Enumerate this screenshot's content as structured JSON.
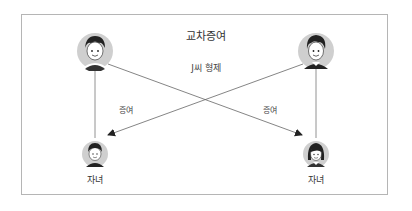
{
  "title": "교차증여",
  "subtitle": "J씨 형제",
  "edges": [
    {
      "label": "증여",
      "from": "parent-left",
      "to": "child-right"
    },
    {
      "label": "증여",
      "from": "parent-right",
      "to": "child-left"
    }
  ],
  "nodes": {
    "parent_left": {
      "role": "parent"
    },
    "parent_right": {
      "role": "parent"
    },
    "child_left": {
      "label": "자녀"
    },
    "child_right": {
      "label": "자녀"
    }
  },
  "colors": {
    "frame": "#b5b5b5",
    "line": "#555555",
    "avatar_bg": "#cfcfcf",
    "hair": "#222222"
  }
}
